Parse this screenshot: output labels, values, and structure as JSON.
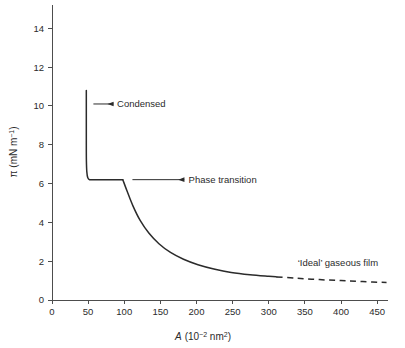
{
  "chart_data": {
    "type": "line",
    "title": "",
    "xlabel": "A (10⁻² nm²)",
    "xlabel_symbol": "A",
    "xlabel_units": "(10",
    "xlabel_exp": "−2",
    "xlabel_units_tail": " nm",
    "xlabel_exp2": "2",
    "xlabel_close": ")",
    "ylabel": "π (mN m⁻¹)",
    "ylabel_symbol": "π",
    "ylabel_units": "(mN m",
    "ylabel_exp": "−1",
    "ylabel_close": ")",
    "xlim": [
      0,
      465
    ],
    "ylim": [
      0,
      15.2
    ],
    "xticks": [
      0,
      50,
      100,
      150,
      200,
      250,
      300,
      350,
      400,
      450
    ],
    "xticklabels": [
      "0",
      "50",
      "100",
      "150",
      "200",
      "250",
      "300",
      "350",
      "400",
      "450"
    ],
    "yticks": [
      0,
      2,
      4,
      6,
      8,
      10,
      12,
      14
    ],
    "yticklabels": [
      "0",
      "2",
      "4",
      "6",
      "8",
      "10",
      "12",
      "14"
    ],
    "grid": false,
    "legend_position": "none",
    "line_color": "#2b2b2b",
    "axis_color": "#4d4d4d",
    "series": [
      {
        "name": "condensed-branch",
        "style": "solid",
        "points": [
          [
            47.5,
            10.8
          ],
          [
            47.5,
            9.5
          ],
          [
            47.5,
            8.2
          ],
          [
            47.6,
            7.2
          ],
          [
            48.2,
            6.6
          ],
          [
            49.5,
            6.3
          ],
          [
            52.0,
            6.2
          ],
          [
            60.0,
            6.2
          ],
          [
            80.0,
            6.2
          ],
          [
            98.0,
            6.2
          ]
        ]
      },
      {
        "name": "gaseous-branch-solid",
        "style": "solid",
        "points": [
          [
            98.0,
            6.2
          ],
          [
            104.0,
            5.6
          ],
          [
            112.0,
            4.85
          ],
          [
            122.0,
            4.1
          ],
          [
            134.0,
            3.45
          ],
          [
            148.0,
            2.9
          ],
          [
            164.0,
            2.45
          ],
          [
            182.0,
            2.1
          ],
          [
            202.0,
            1.82
          ],
          [
            224.0,
            1.6
          ],
          [
            248.0,
            1.42
          ],
          [
            274.0,
            1.3
          ],
          [
            300.0,
            1.22
          ],
          [
            311.0,
            1.19
          ]
        ]
      },
      {
        "name": "ideal-gaseous-extrapolation",
        "style": "dashed",
        "points": [
          [
            311.0,
            1.19
          ],
          [
            340.0,
            1.12
          ],
          [
            370.0,
            1.05
          ],
          [
            400.0,
            1.0
          ],
          [
            430.0,
            0.95
          ],
          [
            463.0,
            0.9
          ]
        ]
      }
    ],
    "annotations": [
      {
        "name": "condensed",
        "text": "Condensed",
        "arrow_tip_x": 49.0,
        "arrow_tip_y": 10.1,
        "arrow_tail_x": 85.0,
        "arrow_tail_y": 10.1,
        "text_x": 90.0,
        "text_y": 10.1
      },
      {
        "name": "phase-transition",
        "text": "Phase transition",
        "arrow_tip_x": 103.0,
        "arrow_tip_y": 6.2,
        "arrow_tail_x": 183.0,
        "arrow_tail_y": 6.2,
        "text_x": 189.0,
        "text_y": 6.2
      },
      {
        "name": "ideal-gaseous-film",
        "text": "‘Ideal’ gaseous film",
        "text_x": 340.0,
        "text_y": 1.95
      }
    ]
  }
}
